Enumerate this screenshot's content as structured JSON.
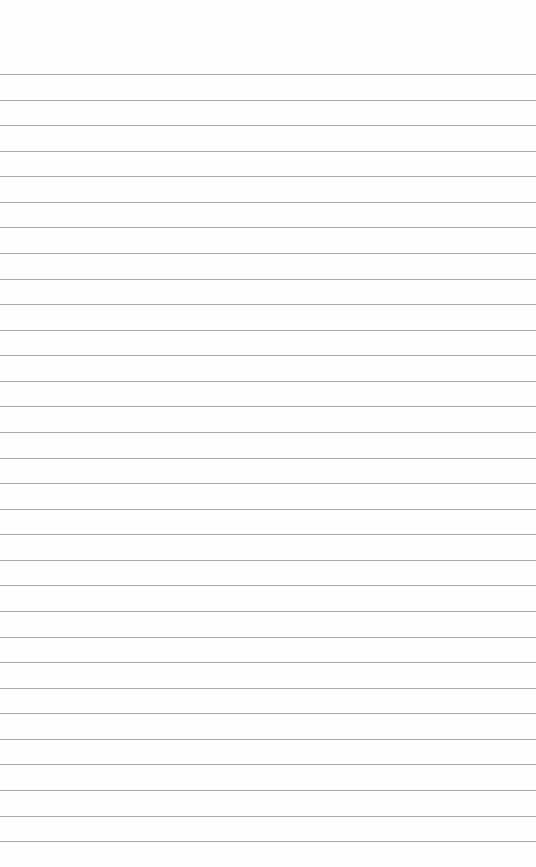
{
  "page": {
    "type": "lined-paper",
    "background_color": "#fefefe",
    "rule_color": "#a9a9a9",
    "first_rule_y": 74,
    "rule_spacing": 25.57,
    "rule_count": 31
  }
}
